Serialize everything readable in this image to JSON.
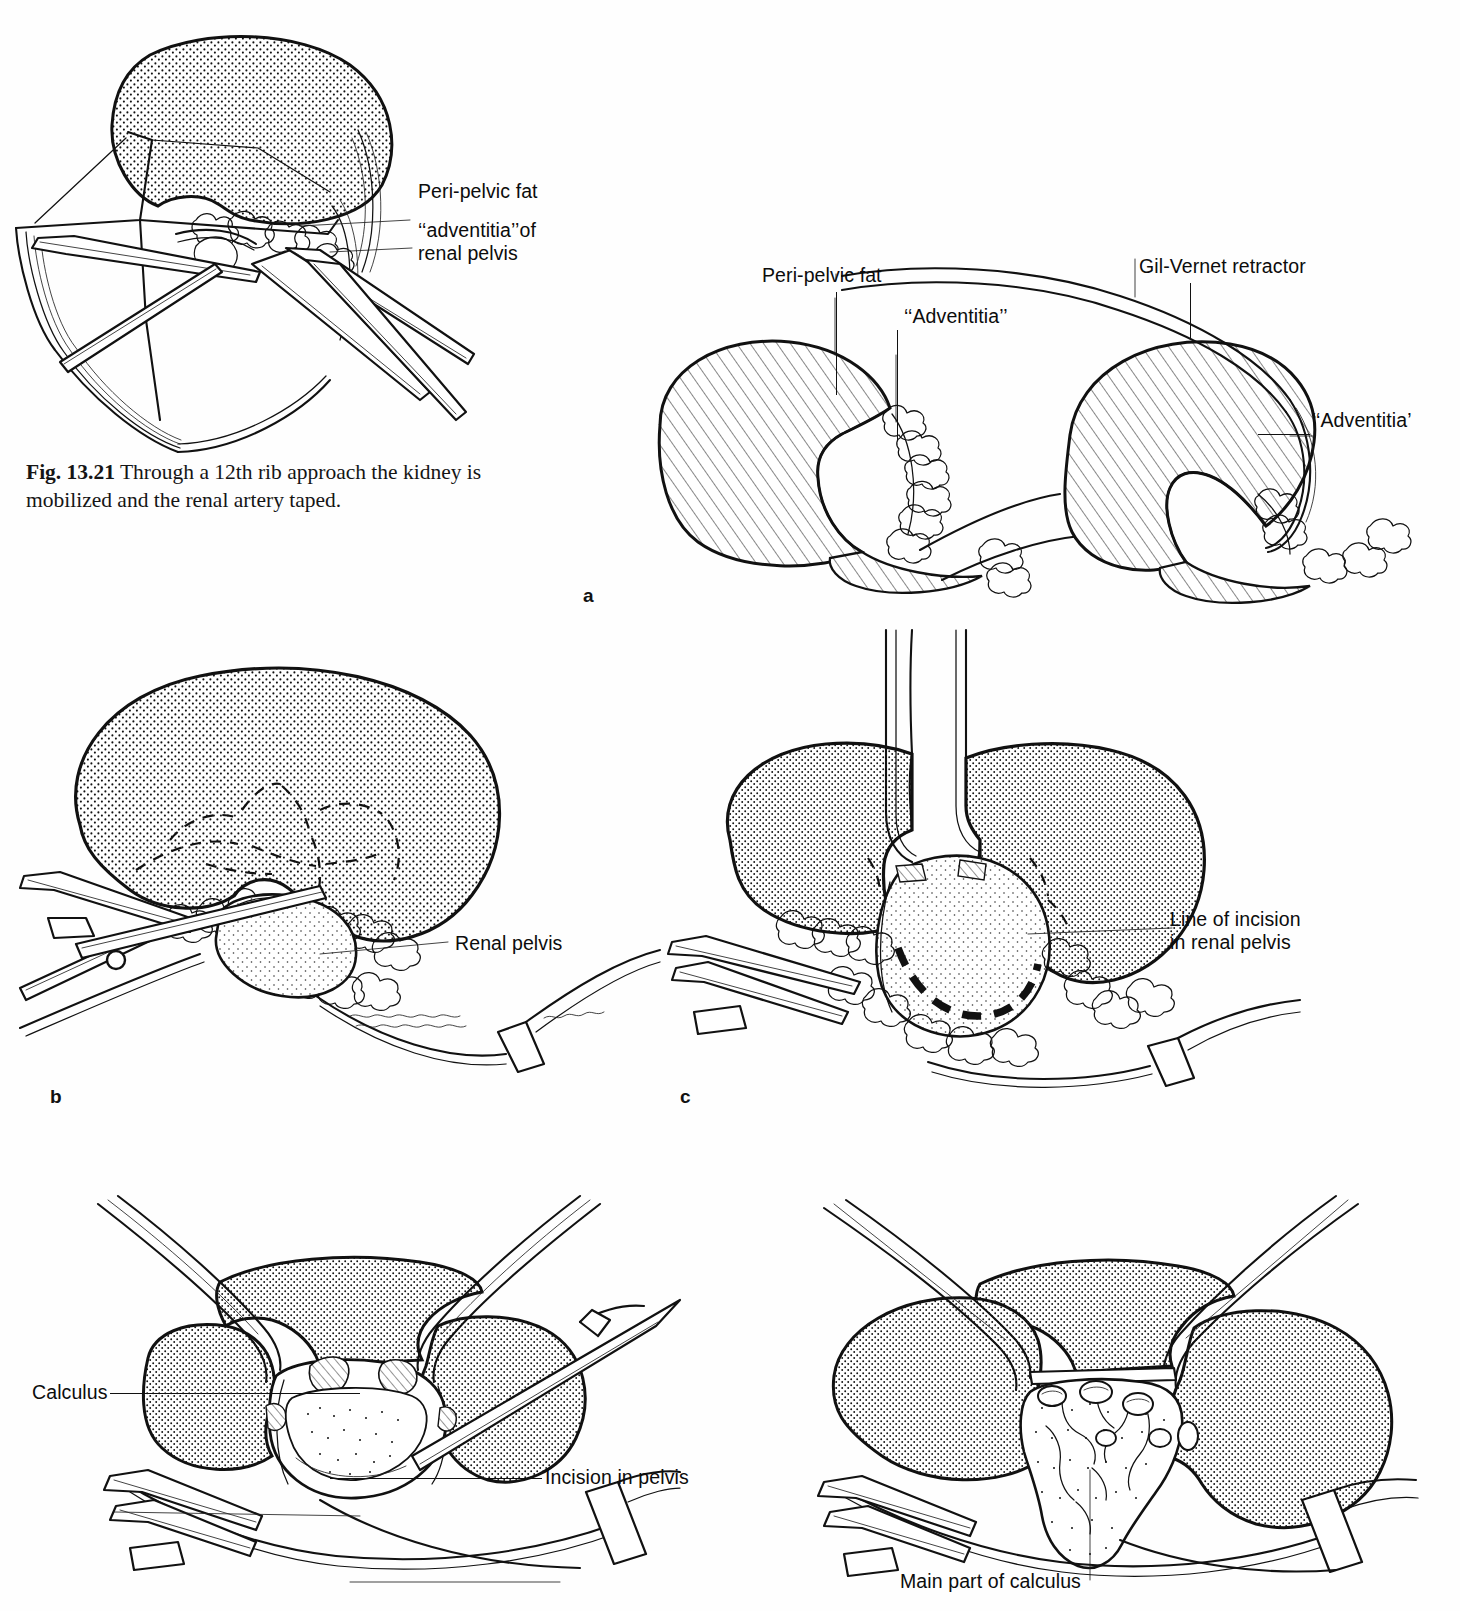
{
  "page": {
    "background_color": "#ffffff",
    "ink_color": "#111111",
    "type": "anatomical-surgical-illustration-plate"
  },
  "caption": {
    "figure_number": "Fig. 13.21",
    "text": "Through a 12th rib approach the kidney is mobilized and the renal artery taped."
  },
  "panels": [
    {
      "id": "fig-13-21",
      "letter": "",
      "title": "12th rib approach – kidney mobilized, renal artery taped",
      "labels": [
        {
          "name": "peri-pelvic-fat",
          "text": "Peri-pelvic fat"
        },
        {
          "name": "adventitia-of-renal-pelvis",
          "text": "‘‘adventitia’’of\nrenal pelvis"
        }
      ]
    },
    {
      "id": "panel-a",
      "letter": "a",
      "title": "Peri-pelvic fat and adventitia; Gil-Vernet retractor applied",
      "labels": [
        {
          "name": "peri-pelvic-fat",
          "text": "Peri-pelvic fat"
        },
        {
          "name": "adventitia-left",
          "text": "‘‘Adventitia’’"
        },
        {
          "name": "gil-vernet-retractor",
          "text": "Gil-Vernet retractor"
        },
        {
          "name": "adventitia-right",
          "text": "‘‘Adventitia’"
        }
      ]
    },
    {
      "id": "panel-b",
      "letter": "b",
      "title": "Renal pelvis exposed with scissors and sling",
      "labels": [
        {
          "name": "renal-pelvis",
          "text": "Renal pelvis"
        }
      ]
    },
    {
      "id": "panel-c",
      "letter": "c",
      "title": "Line of incision marked on the renal pelvis",
      "labels": [
        {
          "name": "line-of-incision-in-renal-pelvis",
          "text": "Line of incision\nin renal pelvis"
        }
      ]
    },
    {
      "id": "panel-d",
      "letter": "d",
      "title": "Pelvis opened revealing calculus",
      "labels": [
        {
          "name": "calculus",
          "text": "Calculus"
        },
        {
          "name": "incision-in-pelvis",
          "text": "Incision in pelvis"
        }
      ]
    },
    {
      "id": "panel-e",
      "letter": "e",
      "title": "Staghorn calculus delivered from the pelvis",
      "labels": [
        {
          "name": "main-part-of-calculus",
          "text": "Main part of calculus"
        }
      ]
    }
  ]
}
